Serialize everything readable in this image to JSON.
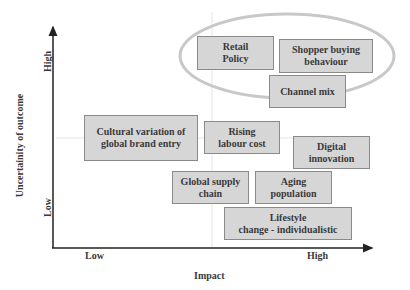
{
  "diagram": {
    "x_axis": {
      "title": "Impact",
      "low_label": "Low",
      "high_label": "High"
    },
    "y_axis": {
      "title": "Uncertainity of outcome",
      "low_label": "Low",
      "high_label": "High"
    },
    "highlight": {
      "type": "ellipse",
      "color": "#c8c8c8",
      "groups": [
        "retail-policy",
        "shopper-buying-behaviour",
        "channel-mix"
      ]
    },
    "box_fill": "#d6d6d6",
    "box_border": "#8a8a8a",
    "items": [
      {
        "id": "retail-policy",
        "text": "Retail\nPolicy",
        "impact": "medium-high",
        "uncertainty": "high"
      },
      {
        "id": "shopper-buying-behaviour",
        "text": "Shopper buying\nbehaviour",
        "impact": "high",
        "uncertainty": "high"
      },
      {
        "id": "channel-mix",
        "text": "Channel mix",
        "impact": "high",
        "uncertainty": "high"
      },
      {
        "id": "cultural-variation",
        "text": "Cultural variation of\nglobal brand entry",
        "impact": "low",
        "uncertainty": "medium"
      },
      {
        "id": "rising-labour-cost",
        "text": "Rising\nlabour cost",
        "impact": "medium",
        "uncertainty": "medium"
      },
      {
        "id": "digital-innovation",
        "text": "Digital\ninnovation",
        "impact": "high",
        "uncertainty": "medium"
      },
      {
        "id": "global-supply-chain",
        "text": "Global supply\nchain",
        "impact": "medium",
        "uncertainty": "medium-low"
      },
      {
        "id": "aging-population",
        "text": "Aging\npopulation",
        "impact": "medium-high",
        "uncertainty": "medium-low"
      },
      {
        "id": "lifestyle-change",
        "text": "Lifestyle\nchange - individualistic",
        "impact": "high",
        "uncertainty": "low"
      }
    ]
  }
}
